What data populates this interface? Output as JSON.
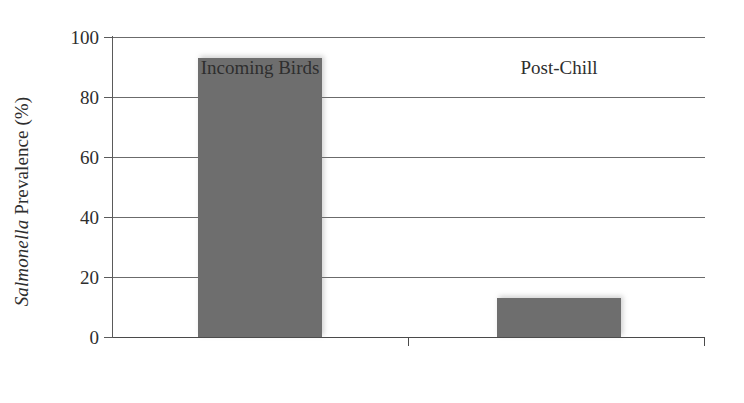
{
  "chart_data": {
    "type": "bar",
    "title": "",
    "xlabel": "",
    "ylabel_prefix": "Salmonella",
    "ylabel_rest": "Prevalence (%)",
    "ylabel": "Salmonella Prevalence (%)",
    "categories": [
      "Incoming Birds",
      "Post-Chill"
    ],
    "values": [
      93,
      13
    ],
    "ylim": [
      0,
      100
    ],
    "yticks": [
      0,
      20,
      40,
      60,
      80,
      100
    ],
    "ytick_labels": [
      "0",
      "20",
      "40",
      "60",
      "80",
      "100"
    ],
    "grid": "horizontal",
    "legend": "none",
    "bar_color": "#6e6e6e",
    "axis_color": "#5a5a5a",
    "gridline_color": "#6b6b6b",
    "background_color": "#ffffff"
  }
}
